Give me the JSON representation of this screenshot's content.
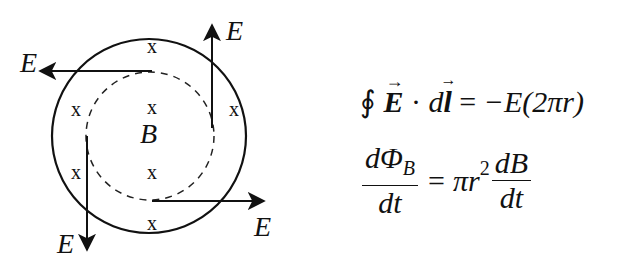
{
  "diagram": {
    "outer_circle": {
      "cx": 149,
      "cy": 136,
      "r": 97
    },
    "inner_circle_dashed": {
      "cx": 150,
      "cy": 136,
      "r": 64
    },
    "field_label": "B",
    "x_marks": {
      "glyph": "x",
      "positions": [
        [
          152,
          47
        ],
        [
          76,
          110
        ],
        [
          152,
          108
        ],
        [
          234,
          110
        ],
        [
          76,
          173
        ],
        [
          152,
          173
        ],
        [
          152,
          224
        ]
      ]
    },
    "arrows": [
      {
        "label": "E",
        "direction": "left",
        "from": [
          152,
          71
        ],
        "to": [
          40,
          71
        ],
        "label_pos": [
          20,
          72
        ]
      },
      {
        "label": "E",
        "direction": "up",
        "from": [
          212,
          128
        ],
        "to": [
          212,
          25
        ],
        "label_pos": [
          228,
          40
        ]
      },
      {
        "label": "E",
        "direction": "down",
        "from": [
          87,
          136
        ],
        "to": [
          87,
          248
        ],
        "label_pos": [
          58,
          252
        ]
      },
      {
        "label": "E",
        "direction": "right",
        "from": [
          152,
          201
        ],
        "to": [
          262,
          201
        ],
        "label_pos": [
          255,
          236
        ]
      }
    ],
    "color": "#111111"
  },
  "equations": {
    "line1": {
      "oint": "∮",
      "E_vec": "E",
      "dot": "·",
      "d": "d",
      "l_vec": "l",
      "equals": "=",
      "rhs": "−E(2πr)"
    },
    "line2": {
      "lhs_num": "dΦ",
      "lhs_num_sub": "B",
      "lhs_den": "dt",
      "equals": "=",
      "coef": "πr",
      "coef_sup": "2",
      "rhs_num": "dB",
      "rhs_den": "dt"
    }
  }
}
